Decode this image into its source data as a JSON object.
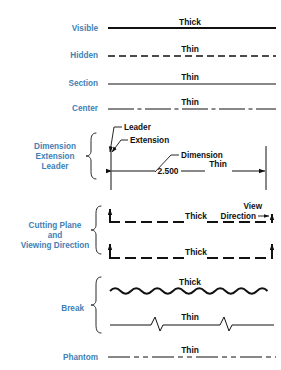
{
  "colors": {
    "label_blue": "#3f7fb5",
    "ink": "#111111",
    "background": "#ffffff"
  },
  "weights": {
    "thick": "Thick",
    "thin": "Thin"
  },
  "rows": [
    {
      "id": "visible",
      "label": "Visible",
      "weight_label": "Thick",
      "style": "continuous",
      "stroke": 2.1,
      "y": 28
    },
    {
      "id": "hidden",
      "label": "Hidden",
      "weight_label": "Thin",
      "style": "dashed",
      "stroke": 1.3,
      "dash": "7,4",
      "y": 55
    },
    {
      "id": "section",
      "label": "Section",
      "weight_label": "Thin",
      "style": "continuous",
      "stroke": 1.1,
      "y": 83
    },
    {
      "id": "center",
      "label": "Center",
      "weight_label": "Thin",
      "style": "center",
      "stroke": 1.0,
      "dash": "26,3.5,4,3.5",
      "y": 108
    }
  ],
  "dimension_group": {
    "label_lines": [
      "Dimension",
      "Extension",
      "Leader"
    ],
    "annotations": {
      "leader": "Leader",
      "extension": "Extension",
      "dimension": "Dimension",
      "value": "2.500",
      "weight_label": "Thin"
    },
    "dimension_value": 2.5
  },
  "cutting_group": {
    "label_lines": [
      "Cutting Plane",
      "and",
      "Viewing Direction"
    ],
    "annotations": {
      "view_direction_line1": "View",
      "view_direction_line2": "Direction"
    },
    "lines": [
      {
        "id": "cutting-plane-upper",
        "weight_label": "Thick",
        "style": "long-dash",
        "stroke": 2.0,
        "dash": "11,5",
        "y": 222
      },
      {
        "id": "cutting-plane-lower",
        "weight_label": "Thick",
        "style": "long-dash",
        "stroke": 2.0,
        "dash": "11,5",
        "y": 258
      }
    ]
  },
  "break_group": {
    "label": "Break",
    "lines": [
      {
        "id": "break-wavy",
        "weight_label": "Thick",
        "style": "wavy",
        "stroke": 1.9,
        "y": 290
      },
      {
        "id": "break-zigzag",
        "weight_label": "Thin",
        "style": "zigzag",
        "stroke": 1.0,
        "y": 325
      }
    ]
  },
  "phantom_row": {
    "id": "phantom",
    "label": "Phantom",
    "weight_label": "Thin",
    "style": "phantom",
    "stroke": 1.2,
    "dash": "22,4,5,4,5,4",
    "y": 357
  }
}
